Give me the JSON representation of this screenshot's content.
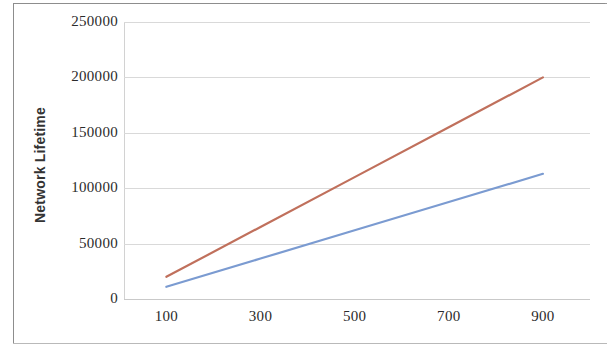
{
  "chart_data": {
    "type": "line",
    "title": "",
    "xlabel": "",
    "ylabel": "Network Lifetime",
    "x": [
      100,
      300,
      500,
      700,
      900
    ],
    "xtick_labels": [
      "100",
      "300",
      "500",
      "700",
      "900"
    ],
    "ytick_labels": [
      "0",
      "50000",
      "100000",
      "150000",
      "200000",
      "250000"
    ],
    "ytick_values": [
      0,
      50000,
      100000,
      150000,
      200000,
      250000
    ],
    "xlim": [
      10,
      1000
    ],
    "ylim": [
      0,
      250000
    ],
    "grid": true,
    "legend": "none",
    "series": [
      {
        "name": "series-red",
        "color": "#C0705C",
        "values": [
          20000,
          65000,
          110000,
          155000,
          200000
        ]
      },
      {
        "name": "series-blue",
        "color": "#7B9BD1",
        "values": [
          11000,
          36500,
          62000,
          87500,
          113000
        ]
      }
    ]
  },
  "axes": {
    "y_title": "Network Lifetime",
    "y_ticks": [
      {
        "label": "250000",
        "value": 250000
      },
      {
        "label": "200000",
        "value": 200000
      },
      {
        "label": "150000",
        "value": 150000
      },
      {
        "label": "100000",
        "value": 100000
      },
      {
        "label": "50000",
        "value": 50000
      },
      {
        "label": "0",
        "value": 0
      }
    ],
    "x_ticks": [
      {
        "label": "100",
        "value": 100
      },
      {
        "label": "300",
        "value": 300
      },
      {
        "label": "500",
        "value": 500
      },
      {
        "label": "700",
        "value": 700
      },
      {
        "label": "900",
        "value": 900
      }
    ]
  },
  "style": {
    "background": "#ffffff",
    "gridline_color": "#d9d9d9",
    "axis_color": "#c9c9c9",
    "frame_color": "#8d8d8d",
    "tick_text_color": "#2b2b2b",
    "title_text_color": "#333333"
  }
}
